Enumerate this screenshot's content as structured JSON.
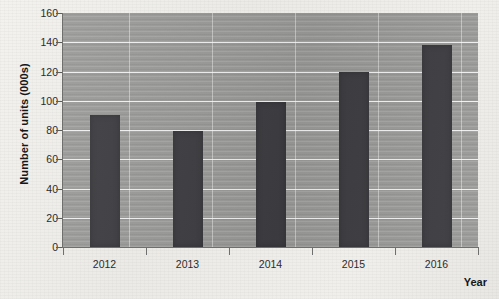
{
  "chart_data": {
    "type": "bar",
    "title": "",
    "subtitle": "",
    "categories": [
      "2012",
      "2013",
      "2014",
      "2015",
      "2016"
    ],
    "values": [
      90,
      79,
      99,
      120,
      138
    ],
    "series": [
      {
        "name": "Number of units (000s)",
        "values": [
          90,
          79,
          99,
          120,
          138
        ]
      }
    ],
    "xlabel": "Year",
    "ylabel": "Number of units (000s)",
    "ylim": [
      0,
      160
    ],
    "ytick_values": [
      0,
      20,
      40,
      60,
      80,
      100,
      120,
      140,
      160
    ],
    "ytick_labels": [
      "0",
      "20",
      "40",
      "60",
      "80",
      "100",
      "120",
      "140",
      "160"
    ],
    "ytick_step": 20,
    "grid": {
      "horizontal": true,
      "vertical": true,
      "color": "#ffffff"
    },
    "legend": {
      "visible": false,
      "position": "none"
    },
    "annotations": [],
    "colors": {
      "bar": "#3d3d42",
      "plot_background": "#9a9b98",
      "page_background": "#efeeea",
      "gridline": "#ffffff",
      "axis": "#6f6f6e",
      "text": "#17171a"
    }
  },
  "axes": {
    "y_title": "Number of units (000s)",
    "x_title": "Year"
  }
}
